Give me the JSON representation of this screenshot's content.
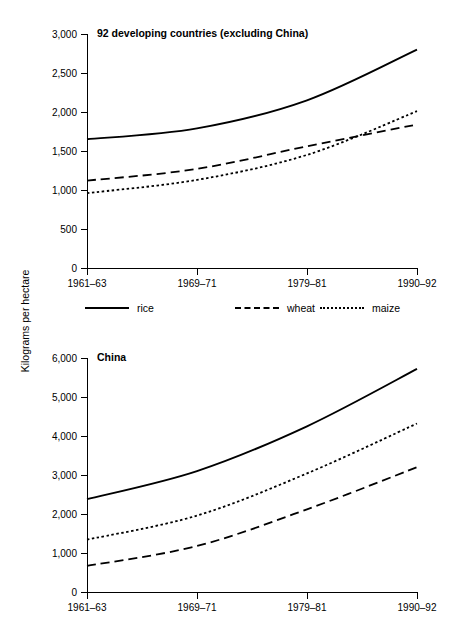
{
  "axis": {
    "y_title": "Kilograms per hectare"
  },
  "legend": {
    "items": [
      {
        "label": "rice",
        "style": "solid"
      },
      {
        "label": "wheat",
        "style": "dashed"
      },
      {
        "label": "maize",
        "style": "dotted"
      }
    ]
  },
  "chart_data": [
    {
      "type": "line",
      "title": "92 developing countries (excluding China)",
      "xlabel": "",
      "ylabel": "Kilograms per hectare",
      "categories": [
        "1961–63",
        "1969–71",
        "1979–81",
        "1990–92"
      ],
      "yticks": [
        "0",
        "500",
        "1,000",
        "1,500",
        "2,000",
        "2,500",
        "3,000"
      ],
      "ytick_values": [
        0,
        500,
        1000,
        1500,
        2000,
        2500,
        3000
      ],
      "ylim": [
        0,
        3000
      ],
      "grid": false,
      "legend_position": "below",
      "series": [
        {
          "name": "rice",
          "style": "solid",
          "values": [
            1650,
            1790,
            2150,
            2800
          ]
        },
        {
          "name": "wheat",
          "style": "dashed",
          "values": [
            1120,
            1270,
            1560,
            1840
          ]
        },
        {
          "name": "maize",
          "style": "dotted",
          "values": [
            960,
            1130,
            1450,
            2010
          ]
        }
      ]
    },
    {
      "type": "line",
      "title": "China",
      "xlabel": "",
      "ylabel": "Kilograms per hectare",
      "categories": [
        "1961–63",
        "1969–71",
        "1979–81",
        "1990–92"
      ],
      "yticks": [
        "0",
        "1,000",
        "2,000",
        "3,000",
        "4,000",
        "5,000",
        "6,000"
      ],
      "ytick_values": [
        0,
        1000,
        2000,
        3000,
        4000,
        5000,
        6000
      ],
      "ylim": [
        0,
        6000
      ],
      "grid": false,
      "legend_position": "none",
      "series": [
        {
          "name": "rice",
          "style": "solid",
          "values": [
            2380,
            3100,
            4250,
            5720
          ]
        },
        {
          "name": "maize",
          "style": "dotted",
          "values": [
            1340,
            1960,
            3040,
            4320
          ]
        },
        {
          "name": "wheat",
          "style": "dashed",
          "values": [
            670,
            1180,
            2120,
            3200
          ]
        }
      ]
    }
  ]
}
